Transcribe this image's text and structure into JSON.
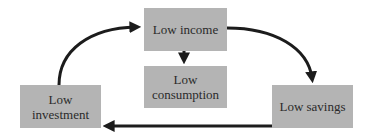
{
  "diagram": {
    "nodes": [
      {
        "id": "low-income",
        "label": "Low income"
      },
      {
        "id": "low-consumption",
        "label_line1": "Low",
        "label_line2": "consumption"
      },
      {
        "id": "low-savings",
        "label": "Low savings"
      },
      {
        "id": "low-investment",
        "label_line1": "Low",
        "label_line2": "investment"
      }
    ],
    "edges": [
      {
        "from": "low-income",
        "to": "low-consumption"
      },
      {
        "from": "low-income",
        "to": "low-savings"
      },
      {
        "from": "low-savings",
        "to": "low-investment"
      },
      {
        "from": "low-investment",
        "to": "low-income"
      }
    ],
    "colors": {
      "box_fill": "#b4b4b4",
      "arrow": "#1c1c1c",
      "text": "#2a2a2a"
    }
  }
}
